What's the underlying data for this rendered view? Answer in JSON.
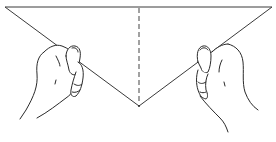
{
  "figure": {
    "elements": {
      "paper": "triangle",
      "fold_line": "dashed-vertical-center",
      "left_hand": "holding-left-edge",
      "right_hand": "holding-right-edge"
    },
    "colors": {
      "ink": "#2a2a2a",
      "fold_line": "#555555",
      "background": "#ffffff"
    }
  }
}
